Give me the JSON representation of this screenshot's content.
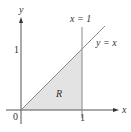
{
  "diagram": {
    "axes": {
      "x_label": "x",
      "y_label": "y",
      "origin_label": "0",
      "x_tick_label": "1",
      "y_tick_label": "1"
    },
    "lines": [
      {
        "label": "x = 1",
        "kind": "vertical"
      },
      {
        "label": "y = x",
        "kind": "diagonal"
      }
    ],
    "region": {
      "label": "R",
      "vertices": [
        [
          0,
          0
        ],
        [
          1,
          0
        ],
        [
          1,
          1
        ]
      ],
      "fill": "#e3e3e3"
    },
    "colors": {
      "axis": "#555555",
      "line": "#8a8a8a",
      "text": "#333333"
    }
  }
}
